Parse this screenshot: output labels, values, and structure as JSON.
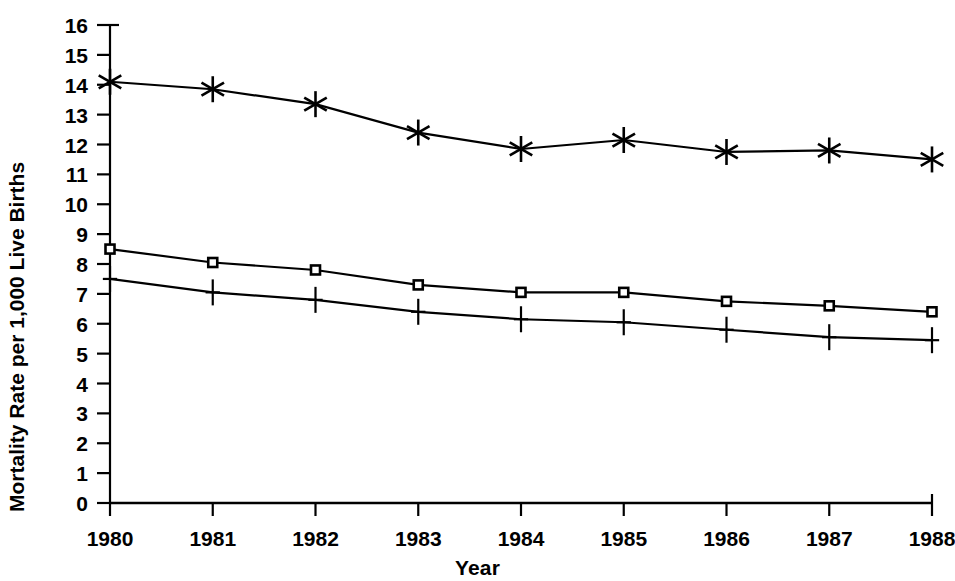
{
  "chart_data": {
    "type": "line",
    "title": "",
    "xlabel": "Year",
    "ylabel": "Mortality Rate per 1,000 Live Births",
    "x": [
      1980,
      1981,
      1982,
      1983,
      1984,
      1985,
      1986,
      1987,
      1988
    ],
    "categories": [
      "1980",
      "1981",
      "1982",
      "1983",
      "1984",
      "1985",
      "1986",
      "1987",
      "1988"
    ],
    "xlim": [
      1980,
      1988
    ],
    "ylim": [
      0,
      16
    ],
    "y_ticks": [
      0,
      1,
      2,
      3,
      4,
      5,
      6,
      7,
      8,
      9,
      10,
      11,
      12,
      13,
      14,
      15,
      16
    ],
    "y_tick_labels": [
      "0",
      "1",
      "2",
      "3",
      "4",
      "5",
      "6",
      "7",
      "8",
      "9",
      "10",
      "11",
      "12",
      "13",
      "14",
      "15",
      "16"
    ],
    "x_tick_labels": [
      "1980",
      "1981",
      "1982",
      "1983",
      "1984",
      "1985",
      "1986",
      "1987",
      "1988"
    ],
    "grid": false,
    "legend": "none",
    "line_color": "#000000",
    "series": [
      {
        "name": "series-asterisk",
        "marker": "asterisk",
        "values": [
          14.1,
          13.85,
          13.35,
          12.4,
          11.85,
          12.15,
          11.75,
          11.8,
          11.5
        ]
      },
      {
        "name": "series-square",
        "marker": "open-square",
        "values": [
          8.5,
          8.05,
          7.8,
          7.3,
          7.05,
          7.05,
          6.75,
          6.6,
          6.4
        ]
      },
      {
        "name": "series-plus",
        "marker": "plus",
        "values": [
          7.5,
          7.05,
          6.8,
          6.4,
          6.15,
          6.05,
          5.8,
          5.55,
          5.45
        ]
      }
    ]
  }
}
